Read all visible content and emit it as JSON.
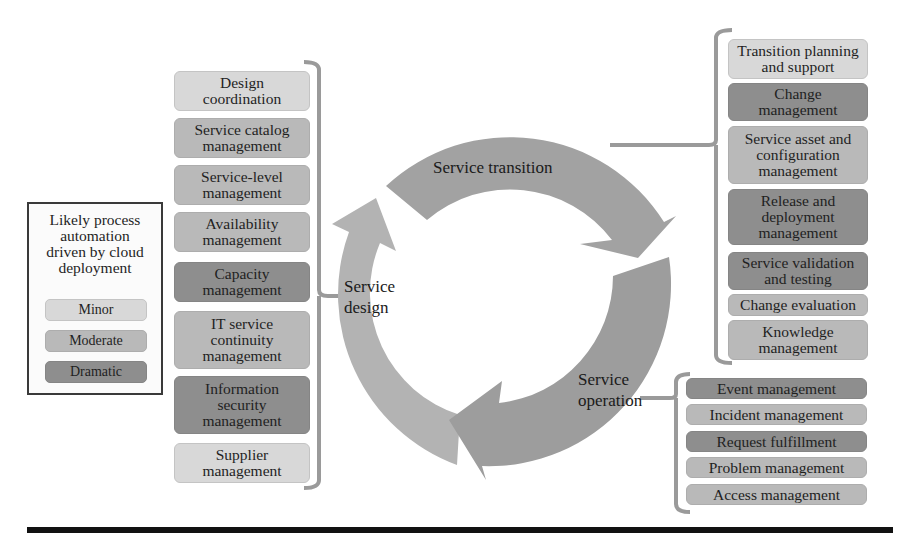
{
  "legend": {
    "title": "Likely process\nautomation\ndriven by cloud\ndeployment",
    "levels": [
      {
        "label": "Minor",
        "color": "#d8d8d8"
      },
      {
        "label": "Moderate",
        "color": "#b9b9b9"
      },
      {
        "label": "Dramatic",
        "color": "#8e8e8e"
      }
    ]
  },
  "cycle": {
    "stages": [
      {
        "label": "Service\ndesign",
        "color": "#b3b3b3"
      },
      {
        "label": "Service transition",
        "color": "#a2a2a2"
      },
      {
        "label": "Service\noperation",
        "color": "#9d9d9d"
      }
    ]
  },
  "service_design": {
    "processes": [
      {
        "label": "Design\ncoordination",
        "level": "Minor"
      },
      {
        "label": "Service catalog\nmanagement",
        "level": "Moderate"
      },
      {
        "label": "Service-level\nmanagement",
        "level": "Moderate"
      },
      {
        "label": "Availability\nmanagement",
        "level": "Moderate"
      },
      {
        "label": "Capacity\nmanagement",
        "level": "Dramatic"
      },
      {
        "label": "IT service\ncontinuity\nmanagement",
        "level": "Moderate"
      },
      {
        "label": "Information\nsecurity\nmanagement",
        "level": "Dramatic"
      },
      {
        "label": "Supplier\nmanagement",
        "level": "Minor"
      }
    ]
  },
  "service_transition": {
    "processes": [
      {
        "label": "Transition planning\nand support",
        "level": "Minor"
      },
      {
        "label": "Change\nmanagement",
        "level": "Dramatic"
      },
      {
        "label": "Service asset and\nconfiguration\nmanagement",
        "level": "Moderate"
      },
      {
        "label": "Release and\ndeployment\nmanagement",
        "level": "Dramatic"
      },
      {
        "label": "Service validation\nand testing",
        "level": "Dramatic"
      },
      {
        "label": "Change evaluation",
        "level": "Moderate"
      },
      {
        "label": "Knowledge\nmanagement",
        "level": "Moderate"
      }
    ]
  },
  "service_operation": {
    "processes": [
      {
        "label": "Event management",
        "level": "Dramatic"
      },
      {
        "label": "Incident management",
        "level": "Moderate"
      },
      {
        "label": "Request fulfillment",
        "level": "Dramatic"
      },
      {
        "label": "Problem management",
        "level": "Moderate"
      },
      {
        "label": "Access management",
        "level": "Moderate"
      }
    ]
  }
}
